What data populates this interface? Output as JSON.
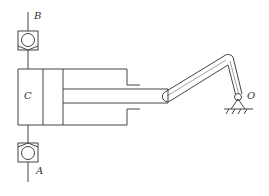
{
  "diagram": {
    "type": "mechanism-schematic",
    "labels": {
      "valve_top": "B",
      "valve_bottom": "A",
      "cylinder_chamber": "C",
      "pivot": "O"
    },
    "colors": {
      "line": "#444444",
      "background": "#ffffff"
    }
  }
}
